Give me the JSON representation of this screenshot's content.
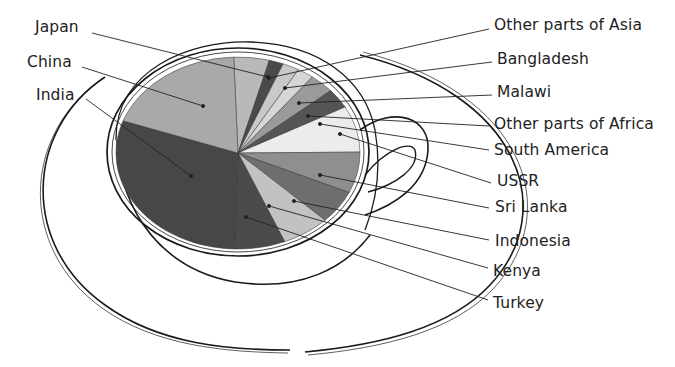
{
  "chart_data": {
    "type": "pie",
    "title": "",
    "style": "pie drawn inside a teacup viewed from above",
    "center": [
      238,
      153
    ],
    "radii": [
      122,
      96
    ],
    "start_angle_deg": -92,
    "categories": [
      "Japan",
      "Other parts of Asia",
      "Bangladesh",
      "Malawi",
      "Other parts of Africa",
      "South America",
      "USSR",
      "Sri Lanka",
      "Indonesia",
      "Kenya",
      "Turkey",
      "India",
      "China"
    ],
    "values": [
      4.7,
      1.9,
      2.2,
      2.2,
      3.3,
      3.3,
      7.8,
      6.9,
      5.6,
      6.4,
      6.7,
      30.0,
      19.0
    ],
    "units": "approx. % share (estimated from slice angles)",
    "colors": [
      "#b9b9b9",
      "#4a4a4a",
      "#c9c9c9",
      "#d6d6d6",
      "#9a9a9a",
      "#555555",
      "#ececec",
      "#8f8f8f",
      "#6e6e6e",
      "#c2c2c2",
      "#4b4b4b",
      "#474747",
      "#a9a9a9"
    ],
    "legend": "callout labels with leader lines"
  },
  "labels": [
    {
      "text": "Japan",
      "x": 35,
      "y": 18,
      "anchor": [
        268,
        77
      ],
      "from": [
        92,
        33
      ]
    },
    {
      "text": "China",
      "x": 27,
      "y": 53,
      "anchor": [
        203,
        106
      ],
      "from": [
        82,
        67
      ]
    },
    {
      "text": "India",
      "x": 36,
      "y": 86,
      "anchor": [
        191,
        176
      ],
      "from": [
        86,
        99
      ]
    },
    {
      "text": "Other parts of Asia",
      "x": 494,
      "y": 16,
      "anchor": [
        269,
        78
      ],
      "from": [
        489,
        29
      ]
    },
    {
      "text": "Bangladesh",
      "x": 497,
      "y": 50,
      "anchor": [
        285,
        88
      ],
      "from": [
        492,
        62
      ]
    },
    {
      "text": "Malawi",
      "x": 497,
      "y": 83,
      "anchor": [
        299,
        103
      ],
      "from": [
        492,
        95
      ]
    },
    {
      "text": "Other parts of Africa",
      "x": 494,
      "y": 115,
      "anchor": [
        308,
        116
      ],
      "from": [
        489,
        126
      ]
    },
    {
      "text": "South America",
      "x": 494,
      "y": 141,
      "anchor": [
        320,
        124
      ],
      "from": [
        489,
        150
      ]
    },
    {
      "text": "USSR",
      "x": 497,
      "y": 172,
      "anchor": [
        340,
        134
      ],
      "from": [
        491,
        183
      ]
    },
    {
      "text": "Sri Lanka",
      "x": 495,
      "y": 198,
      "anchor": [
        320,
        175
      ],
      "from": [
        489,
        208
      ]
    },
    {
      "text": "Indonesia",
      "x": 495,
      "y": 232,
      "anchor": [
        294,
        201
      ],
      "from": [
        489,
        240
      ]
    },
    {
      "text": "Kenya",
      "x": 493,
      "y": 262,
      "anchor": [
        269,
        206
      ],
      "from": [
        488,
        268
      ]
    },
    {
      "text": "Turkey",
      "x": 493,
      "y": 294,
      "anchor": [
        246,
        217
      ],
      "from": [
        488,
        300
      ]
    }
  ]
}
